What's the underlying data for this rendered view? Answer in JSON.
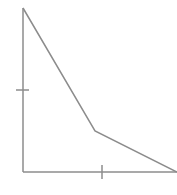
{
  "diagram": {
    "stroke_color": "#8c8c8c",
    "stroke_width": 1.5,
    "axes": {
      "origin": [
        23,
        172
      ],
      "y_axis_top": [
        23,
        8
      ],
      "x_axis_right": [
        177,
        172
      ]
    },
    "curve": {
      "points": [
        [
          23,
          8
        ],
        [
          95,
          131
        ],
        [
          177,
          172
        ]
      ]
    },
    "ticks": {
      "y_tick": {
        "x1": 16,
        "y1": 90,
        "x2": 29,
        "y2": 90
      },
      "x_tick": {
        "x1": 102,
        "y1": 165,
        "x2": 102,
        "y2": 179
      }
    }
  }
}
